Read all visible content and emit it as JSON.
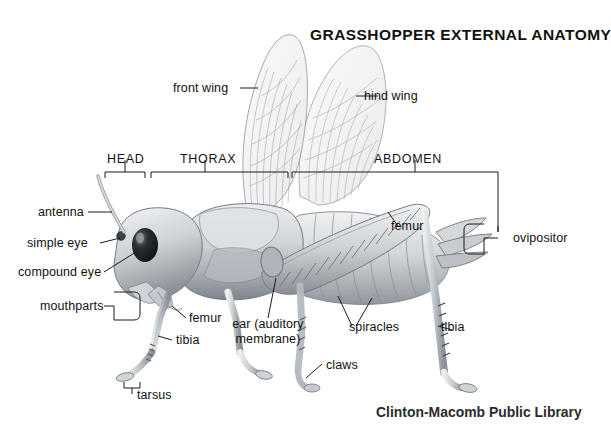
{
  "title": "GRASSHOPPER EXTERNAL ANATOMY",
  "credit": "Clinton-Macomb Public Library",
  "sections": [
    {
      "name": "head",
      "label": "HEAD"
    },
    {
      "name": "thorax",
      "label": "THORAX"
    },
    {
      "name": "abdomen",
      "label": "ABDOMEN"
    }
  ],
  "labels": [
    {
      "name": "front-wing",
      "text": "front wing"
    },
    {
      "name": "hind-wing",
      "text": "hind wing"
    },
    {
      "name": "antenna",
      "text": "antenna"
    },
    {
      "name": "simple-eye",
      "text": "simple eye"
    },
    {
      "name": "compound-eye",
      "text": "compound eye"
    },
    {
      "name": "mouthparts",
      "text": "mouthparts"
    },
    {
      "name": "fore-femur",
      "text": "femur"
    },
    {
      "name": "fore-tibia",
      "text": "tibia"
    },
    {
      "name": "tarsus",
      "text": "tarsus"
    },
    {
      "name": "ear",
      "text": "ear (auditory membrane)"
    },
    {
      "name": "claws",
      "text": "claws"
    },
    {
      "name": "hind-femur",
      "text": "femur"
    },
    {
      "name": "spiracles",
      "text": "spiracles"
    },
    {
      "name": "hind-tibia",
      "text": "tibia"
    },
    {
      "name": "ovipositor",
      "text": "ovipositor"
    }
  ],
  "colors": {
    "background": "#ffffff",
    "ink": "#111111",
    "leader": "#1a1a1a",
    "body_light": "#e4e6e8",
    "body_mid": "#b9bec3",
    "body_dark": "#8d9399",
    "body_shadow": "#6e747a",
    "wing_fill": "#f2f3f4",
    "wing_vein": "#9aa0a6",
    "eye_dark": "#121316"
  }
}
